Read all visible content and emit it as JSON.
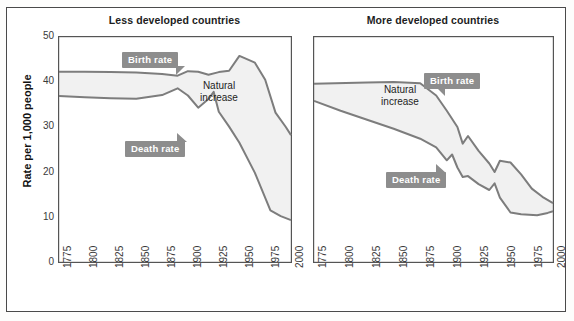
{
  "figure": {
    "ylabel": "Rate per 1,000 people"
  },
  "chart_data": [
    {
      "type": "line",
      "title": "Less developed countries",
      "xlabel": "",
      "ylabel": "Rate per 1,000 people",
      "xlim": [
        1775,
        2000
      ],
      "ylim": [
        0,
        50
      ],
      "ytick_labels": [
        "0",
        "10",
        "20",
        "30",
        "40",
        "50"
      ],
      "ytick_values": [
        0,
        10,
        20,
        30,
        40,
        50
      ],
      "xtick_labels": [
        "1775",
        "1800",
        "1825",
        "1850",
        "1875",
        "1900",
        "1925",
        "1950",
        "1975",
        "2000"
      ],
      "xtick_values": [
        1775,
        1800,
        1825,
        1850,
        1875,
        1900,
        1925,
        1950,
        1975,
        2000
      ],
      "grid": false,
      "legend_position": "inline-callouts",
      "annotations": [
        "Natural increase"
      ],
      "series": [
        {
          "name": "Birth rate",
          "x": [
            1775,
            1800,
            1825,
            1850,
            1875,
            1890,
            1900,
            1910,
            1920,
            1930,
            1940,
            1950,
            1955,
            1965,
            1975,
            1985,
            1995,
            2000
          ],
          "values": [
            42.3,
            42.3,
            42.2,
            42.1,
            41.8,
            41.4,
            42.4,
            42.3,
            41.6,
            42.2,
            42.5,
            45.8,
            45.3,
            44.3,
            40.5,
            33.2,
            30.0,
            28.2
          ]
        },
        {
          "name": "Death rate",
          "x": [
            1775,
            1800,
            1825,
            1850,
            1875,
            1890,
            1900,
            1910,
            1920,
            1925,
            1930,
            1940,
            1950,
            1965,
            1980,
            1990,
            2000
          ],
          "values": [
            36.9,
            36.6,
            36.4,
            36.3,
            37.1,
            38.6,
            37.0,
            34.3,
            36.2,
            37.8,
            33.4,
            30.1,
            26.5,
            19.8,
            11.5,
            10.2,
            9.3
          ]
        }
      ]
    },
    {
      "type": "line",
      "title": "More developed countries",
      "xlabel": "",
      "ylabel": "Rate per 1,000 people",
      "xlim": [
        1775,
        2000
      ],
      "ylim": [
        0,
        50
      ],
      "ytick_labels": [
        "0",
        "10",
        "20",
        "30",
        "40",
        "50"
      ],
      "ytick_values": [
        0,
        10,
        20,
        30,
        40,
        50
      ],
      "xtick_labels": [
        "1775",
        "1800",
        "1825",
        "1850",
        "1875",
        "1900",
        "1925",
        "1950",
        "1975",
        "2000"
      ],
      "xtick_values": [
        1775,
        1800,
        1825,
        1850,
        1875,
        1900,
        1925,
        1950,
        1975,
        2000
      ],
      "grid": false,
      "legend_position": "inline-callouts",
      "annotations": [
        "Natural increase"
      ],
      "series": [
        {
          "name": "Birth rate",
          "x": [
            1775,
            1825,
            1850,
            1875,
            1890,
            1900,
            1910,
            1915,
            1920,
            1930,
            1940,
            1945,
            1950,
            1960,
            1970,
            1980,
            1990,
            2000
          ],
          "values": [
            39.6,
            39.9,
            40.0,
            39.7,
            37.0,
            33.6,
            30.0,
            26.3,
            28.0,
            24.7,
            21.9,
            20.0,
            22.5,
            22.1,
            19.5,
            16.3,
            14.5,
            13.1
          ]
        },
        {
          "name": "Death rate",
          "x": [
            1775,
            1800,
            1825,
            1850,
            1875,
            1890,
            1900,
            1905,
            1910,
            1915,
            1920,
            1930,
            1940,
            1945,
            1950,
            1960,
            1970,
            1985,
            1995,
            2000
          ],
          "values": [
            35.8,
            33.6,
            31.6,
            29.6,
            27.4,
            25.5,
            22.6,
            23.9,
            21.0,
            18.9,
            19.1,
            17.3,
            16.0,
            17.5,
            14.3,
            11.0,
            10.6,
            10.4,
            10.9,
            11.3
          ]
        }
      ]
    }
  ],
  "panels": {
    "left": {
      "title": "Less developed countries",
      "callouts": [
        {
          "name": "birth-rate-callout",
          "label": "Birth rate"
        },
        {
          "name": "death-rate-callout",
          "label": "Death rate"
        }
      ],
      "annotation": {
        "line1": "Natural",
        "line2": "increase"
      }
    },
    "right": {
      "title": "More developed countries",
      "callouts": [
        {
          "name": "birth-rate-callout",
          "label": "Birth rate"
        },
        {
          "name": "death-rate-callout",
          "label": "Death rate"
        }
      ],
      "annotation": {
        "line1": "Natural",
        "line2": "increase"
      }
    }
  },
  "colors": {
    "line": "#7d7d7d",
    "callout_bg": "#8d8d8d",
    "callout_text": "#ffffff",
    "fill": "#f2f2f2",
    "axis": "#555555",
    "text": "#1d1d1d"
  }
}
